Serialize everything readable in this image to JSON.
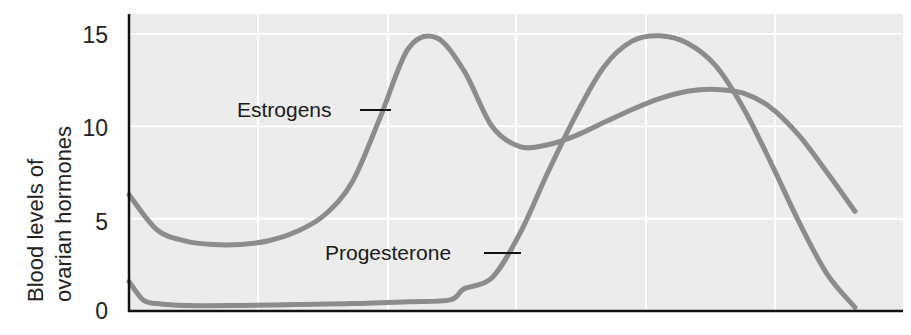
{
  "chart_data": {
    "type": "line",
    "title": "",
    "xlabel": "",
    "ylabel": "Blood levels of ovarian hormones",
    "ylabel_lines": [
      "Blood levels of",
      "ovarian hormones"
    ],
    "ylim": [
      0,
      16
    ],
    "yticks": [
      0,
      5,
      10,
      15
    ],
    "ytick_labels": [
      "0",
      "5",
      "10",
      "15"
    ],
    "xlim": [
      0,
      28
    ],
    "xticks_gridlines": [
      4.7,
      9.4,
      14.0,
      18.7,
      23.4
    ],
    "grid": true,
    "legend": "inline annotations",
    "series": [
      {
        "name": "Estrogens",
        "x": [
          0,
          1,
          2,
          3,
          4,
          5,
          6,
          7,
          8,
          9,
          10,
          11,
          12,
          13,
          14,
          15,
          16,
          17,
          18,
          19,
          20,
          21,
          22,
          23,
          24,
          25,
          26
        ],
        "values": [
          6.3,
          4.4,
          3.8,
          3.6,
          3.6,
          3.8,
          4.3,
          5.2,
          7.0,
          10.5,
          14.2,
          14.8,
          13.0,
          10.0,
          8.9,
          9.0,
          9.5,
          10.2,
          10.9,
          11.5,
          11.9,
          12.0,
          11.8,
          11.0,
          9.5,
          7.5,
          5.4
        ]
      },
      {
        "name": "Progesterone",
        "x": [
          0,
          0.5,
          1,
          2,
          4,
          6,
          8,
          10,
          11.5,
          12,
          13,
          14,
          15,
          16,
          17,
          18,
          19,
          20,
          21,
          22,
          23,
          24,
          25,
          26
        ],
        "values": [
          1.6,
          0.6,
          0.4,
          0.3,
          0.3,
          0.35,
          0.4,
          0.5,
          0.6,
          1.2,
          1.8,
          4.2,
          7.5,
          10.6,
          13.2,
          14.6,
          14.9,
          14.5,
          13.3,
          11.0,
          8.0,
          4.8,
          2.0,
          0.2
        ]
      }
    ],
    "annotations": [
      {
        "text": "Estrogens",
        "target_series": "Estrogens"
      },
      {
        "text": "Progesterone",
        "target_series": "Progesterone"
      }
    ]
  },
  "colors": {
    "plot_background": "#ececec",
    "gridline": "#ffffff",
    "curve": "#8c8c8c",
    "axis": "#111111",
    "text": "#222222"
  }
}
